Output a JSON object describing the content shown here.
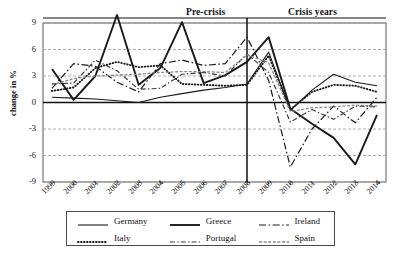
{
  "chart_data": {
    "type": "line",
    "title": "",
    "xlabel": "",
    "ylabel": "change in %",
    "ylim": [
      -9,
      9
    ],
    "yticks": [
      9,
      6,
      3,
      0,
      -3,
      -6,
      -9
    ],
    "grid": true,
    "legend_position": "bottom",
    "x": [
      "1999",
      "2000",
      "2001",
      "2002",
      "2003",
      "2004",
      "2005",
      "2006",
      "2007",
      "2008",
      "2009",
      "2010",
      "2011",
      "2012",
      "2013",
      "2014"
    ],
    "annotations": [
      {
        "name": "pre-crisis",
        "text": "Pre-crisis",
        "x_range": [
          "1999",
          "2008"
        ]
      },
      {
        "name": "crisis-years",
        "text": "Crisis years",
        "x_range": [
          "2008",
          "2014"
        ]
      },
      {
        "name": "divider",
        "text": "",
        "at_x": "2008"
      }
    ],
    "series": [
      {
        "name": "Germany",
        "style": "solid-thin",
        "color": "#1a1a1a",
        "values": [
          0.6,
          0.5,
          0.4,
          0.2,
          0.0,
          0.6,
          1.0,
          1.4,
          1.7,
          2.1,
          5.7,
          -0.9,
          1.4,
          3.2,
          2.3,
          1.9
        ]
      },
      {
        "name": "Greece",
        "style": "solid-thick",
        "color": "#1a1a1a",
        "values": [
          3.8,
          0.3,
          3.0,
          9.9,
          2.0,
          3.9,
          9.1,
          2.2,
          3.1,
          4.6,
          7.4,
          -0.7,
          -2.4,
          -4.0,
          -7.0,
          -1.4
        ]
      },
      {
        "name": "Ireland",
        "style": "dash-dot-long",
        "color": "#1a1a1a",
        "values": [
          1.6,
          4.4,
          4.1,
          2.3,
          1.2,
          4.4,
          4.8,
          4.2,
          4.4,
          7.4,
          2.5,
          -7.3,
          -3.0,
          -0.4,
          -2.3,
          0.6
        ]
      },
      {
        "name": "Italy",
        "style": "dotted",
        "color": "#1a1a1a",
        "values": [
          1.3,
          1.7,
          3.9,
          4.6,
          4.0,
          4.2,
          2.1,
          2.0,
          1.9,
          2.0,
          5.3,
          -0.8,
          1.2,
          2.0,
          1.9,
          1.2
        ]
      },
      {
        "name": "Portugal",
        "style": "dash-dot-short",
        "color": "#3a3a3a",
        "values": [
          2.1,
          2.2,
          4.8,
          3.6,
          1.5,
          1.6,
          3.2,
          3.4,
          3.0,
          5.5,
          3.4,
          -2.2,
          -0.8,
          -1.9,
          -0.4,
          -0.5
        ]
      },
      {
        "name": "Spain",
        "style": "dashed-gray",
        "color": "#8a8a8a",
        "values": [
          2.0,
          2.7,
          3.0,
          3.1,
          3.2,
          3.4,
          3.5,
          3.5,
          3.4,
          5.4,
          4.5,
          -1.0,
          -0.6,
          -0.5,
          -0.3,
          -0.4
        ]
      }
    ]
  },
  "axes": {
    "y_label": "change in %",
    "y_ticks": [
      "9",
      "6",
      "3",
      "0",
      "-3",
      "-6",
      "-9"
    ],
    "x_ticks": [
      "1999",
      "2000",
      "2001",
      "2002",
      "2003",
      "2004",
      "2005",
      "2006",
      "2007",
      "2008",
      "2009",
      "2010",
      "2011",
      "2012",
      "2013",
      "2014"
    ]
  },
  "sections": {
    "pre_crisis": "Pre-crisis",
    "crisis_years": "Crisis years"
  },
  "legend": {
    "rows": [
      [
        {
          "label": "Germany",
          "style": "solid-thin"
        },
        {
          "label": "Greece",
          "style": "solid-thick"
        },
        {
          "label": "Ireland",
          "style": "dash-dot-long"
        }
      ],
      [
        {
          "label": "Italy",
          "style": "dotted"
        },
        {
          "label": "Portugal",
          "style": "dash-dot-short"
        },
        {
          "label": "Spain",
          "style": "dashed-gray"
        }
      ]
    ]
  }
}
